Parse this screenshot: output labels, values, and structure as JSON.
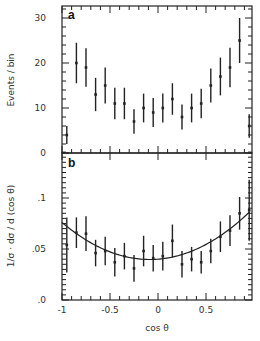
{
  "chart_data": [
    {
      "type": "scatter",
      "panel_label": "a",
      "title": "",
      "xlabel": "",
      "ylabel": "Events / bin",
      "xlim": [
        -1,
        0.95
      ],
      "ylim": [
        0,
        32.5
      ],
      "yticks": [
        0,
        10,
        20,
        30
      ],
      "ytick_labels": [
        "0",
        "10",
        "20",
        "30"
      ],
      "grid": false,
      "series": [
        {
          "name": "data",
          "x": [
            -0.95,
            -0.85,
            -0.75,
            -0.65,
            -0.55,
            -0.45,
            -0.35,
            -0.25,
            -0.15,
            -0.05,
            0.05,
            0.15,
            0.25,
            0.35,
            0.45,
            0.55,
            0.65,
            0.75,
            0.85,
            0.95
          ],
          "y": [
            4,
            20,
            19,
            13,
            15,
            11,
            11,
            7,
            10,
            9,
            10,
            12,
            8,
            10,
            11,
            15,
            17,
            19,
            25,
            6
          ],
          "err_low": [
            2,
            4.5,
            4.3,
            3.7,
            4,
            3.5,
            3.5,
            2.7,
            3.2,
            3.2,
            3.2,
            3.5,
            2.8,
            3.2,
            3.3,
            3.8,
            4.2,
            4.4,
            5,
            2.6
          ],
          "err_high": [
            2,
            4.5,
            4.3,
            3.7,
            4,
            3.5,
            3.5,
            2.7,
            3.2,
            3.2,
            3.2,
            3.5,
            2.8,
            3.2,
            3.3,
            3.8,
            4.2,
            4.4,
            5,
            2.6
          ]
        }
      ]
    },
    {
      "type": "scatter",
      "panel_label": "b",
      "title": "",
      "xlabel": "cos θ",
      "ylabel": "1/σ · dσ / d (cos θ)",
      "xlim": [
        -1,
        0.95
      ],
      "ylim": [
        0,
        0.145
      ],
      "xticks": [
        -1,
        -0.5,
        0,
        0.5
      ],
      "xtick_labels": [
        "-1",
        "-0.5",
        "0",
        "0.5"
      ],
      "yticks": [
        0,
        0.05,
        0.1
      ],
      "ytick_labels": [
        ".0",
        ".05",
        ".1"
      ],
      "grid": false,
      "series": [
        {
          "name": "data",
          "x": [
            -0.95,
            -0.85,
            -0.75,
            -0.65,
            -0.55,
            -0.45,
            -0.35,
            -0.25,
            -0.15,
            -0.05,
            0.05,
            0.15,
            0.25,
            0.35,
            0.45,
            0.55,
            0.65,
            0.75,
            0.85,
            0.95
          ],
          "y": [
            0.054,
            0.066,
            0.065,
            0.046,
            0.048,
            0.037,
            0.043,
            0.031,
            0.048,
            0.041,
            0.043,
            0.058,
            0.035,
            0.04,
            0.037,
            0.048,
            0.062,
            0.068,
            0.085,
            0.088
          ],
          "err": [
            0.027,
            0.015,
            0.017,
            0.013,
            0.014,
            0.014,
            0.013,
            0.013,
            0.015,
            0.013,
            0.014,
            0.016,
            0.013,
            0.012,
            0.011,
            0.012,
            0.015,
            0.015,
            0.016,
            0.03
          ]
        },
        {
          "name": "fit",
          "type": "line",
          "function": "a + b·cosθ + c·cos²θ",
          "params": {
            "a": 0.04,
            "b": 0.0073,
            "c": 0.0433
          }
        }
      ]
    }
  ]
}
